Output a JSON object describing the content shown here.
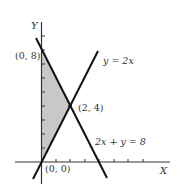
{
  "diagram": {
    "type": "linear-programming-feasible-region",
    "axes": {
      "x_label": "X",
      "y_label": "Y",
      "x_ticks": [
        1,
        2,
        3,
        4,
        5,
        6,
        7
      ],
      "y_ticks": [
        1,
        2,
        3,
        4,
        5,
        6,
        7,
        8,
        9,
        10
      ]
    },
    "lines": [
      {
        "id": "line-y-2x",
        "label": "y = 2x",
        "from": [
          -0.6,
          -1.2
        ],
        "to": [
          3.9,
          7.9
        ]
      },
      {
        "id": "line-2x-y-8",
        "label": "2x + y = 8",
        "from": [
          -0.4,
          8.8
        ],
        "to": [
          4.6,
          -1.2
        ]
      }
    ],
    "points": [
      {
        "label": "(0, 8)",
        "x": 0,
        "y": 8
      },
      {
        "label": "(2, 4)",
        "x": 2,
        "y": 4
      },
      {
        "label": "(0, 0)",
        "x": 0,
        "y": 0
      }
    ],
    "shaded_region": {
      "vertices": [
        [
          0,
          0
        ],
        [
          0,
          8
        ],
        [
          2,
          4
        ]
      ],
      "fill": "#c8c8c8"
    },
    "colors": {
      "line": "#111111",
      "axis": "#333333",
      "text": "#333333",
      "shade": "#c8c8c8"
    }
  }
}
